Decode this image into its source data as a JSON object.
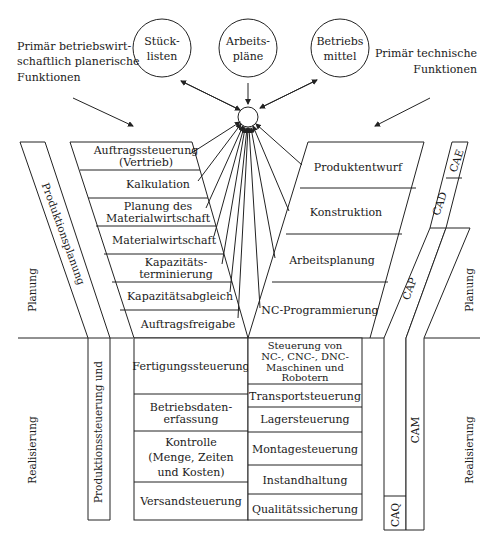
{
  "diagram": {
    "type": "Y-CIM model",
    "data_circles": [
      {
        "line1": "Stück-",
        "line2": "listen"
      },
      {
        "line1": "Arbeits-",
        "line2": "pläne"
      },
      {
        "line1": "Betriebs",
        "line2": "mittel"
      }
    ],
    "left_heading": [
      "Primär betriebswirt-",
      "schaftlich planerische",
      "Funktionen"
    ],
    "right_heading": [
      "Primär technische",
      "Funktionen"
    ],
    "left_planning_boxes": [
      [
        "Auftragssteuerung",
        "(Vertrieb)"
      ],
      [
        "Kalkulation"
      ],
      [
        "Planung des",
        "Primärbedarfes"
      ],
      [
        "Materialwirtschaft"
      ],
      [
        "Kapazitäts-",
        "terminierung"
      ],
      [
        "Kapazitätsabgleich"
      ],
      [
        "Auftragsfreigabe"
      ]
    ],
    "right_planning_boxes": [
      [
        "Produktentwurf"
      ],
      [
        "Konstruktion"
      ],
      [
        "Arbeitsplanung"
      ],
      [
        "NC-Programmierung"
      ]
    ],
    "left_realization_boxes": [
      [
        "Fertigungssteuerung"
      ],
      [
        "Betriebsdaten-",
        "erfassung"
      ],
      [
        "Kontrolle",
        "(Menge, Zeiten",
        "und Kosten)"
      ],
      [
        "Versandsteuerung"
      ]
    ],
    "right_realization_boxes": [
      [
        "Steuerung von",
        "NC-, CNC-, DNC-",
        "Maschinen und",
        "Robotern"
      ],
      [
        "Transportsteuerung"
      ],
      [
        "Lagersteuerung"
      ],
      [
        "Montagesteuerung"
      ],
      [
        "Instandhaltung"
      ],
      [
        "Qualitätssicherung"
      ]
    ],
    "left_band_label": "Produktionsplanung",
    "left_band_label_lower": "Produktionssteuerung und",
    "right_bands": {
      "cae": "CAE",
      "cad": "CAD",
      "cap": "CAP",
      "cam": "CAM",
      "caq": "CAQ"
    },
    "side_labels": {
      "planning_left": "Planung",
      "realization_left": "Realisierung",
      "planning_right": "Planung",
      "realization_right": "Realisierung"
    }
  }
}
